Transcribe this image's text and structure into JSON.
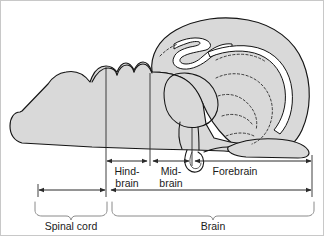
{
  "figure": {
    "background_color": "#ffffff",
    "organ_fill_color": "#d9d9d9",
    "outline_color": "#141414",
    "measure_color": "#2b2b2b",
    "bracket_color": "#8a8a8a",
    "frame_color": "#c8c8c8"
  },
  "region_labels": {
    "hindbrain_line1": "Hind-",
    "hindbrain_line2": "brain",
    "midbrain_line1": "Mid-",
    "midbrain_line2": "brain",
    "forebrain": "Forebrain"
  },
  "bracket_labels": {
    "spinal_cord": "Spinal cord",
    "brain": "Brain"
  },
  "measure_bars": [
    {
      "name": "hindbrain",
      "x_start": 104,
      "x_end": 148,
      "y": 161,
      "arrows": "both"
    },
    {
      "name": "midbrain",
      "x_start": 152,
      "x_end": 190,
      "y": 161,
      "arrows": "both"
    },
    {
      "name": "forebrain",
      "x_start": 194,
      "x_end": 312,
      "y": 161,
      "arrows": "both"
    },
    {
      "name": "spinal-cord",
      "x_start": 38,
      "x_end": 106,
      "y": 190,
      "arrows": "both"
    },
    {
      "name": "brain",
      "x_start": 110,
      "x_end": 312,
      "y": 190,
      "arrows": "both"
    }
  ],
  "dividers": [
    {
      "name": "spinal-hindbrain-boundary",
      "x": 106,
      "y_top": 104,
      "y_bottom": 197
    },
    {
      "name": "hindbrain-midbrain-boundary",
      "x": 150,
      "y_top": 86,
      "y_bottom": 166
    },
    {
      "name": "midbrain-forebrain-boundary",
      "x": 192,
      "y_top": 88,
      "y_bottom": 166
    }
  ],
  "brackets": [
    {
      "name": "spinal-cord-bracket",
      "x_start": 35,
      "x_end": 108,
      "y": 200,
      "depth": 10,
      "label_x": 71,
      "label_y": 227
    },
    {
      "name": "brain-bracket",
      "x_start": 112,
      "x_end": 314,
      "y": 200,
      "depth": 10,
      "label_x": 213,
      "label_y": 227
    }
  ],
  "anatomy_parts": [
    "spinal-cord",
    "medulla",
    "cerebellum",
    "midbrain-tectum",
    "thalamus",
    "hypothalamus",
    "pituitary",
    "cerebral-hemisphere",
    "olfactory-bulb",
    "lateral-ventricle",
    "optic-nerve"
  ]
}
